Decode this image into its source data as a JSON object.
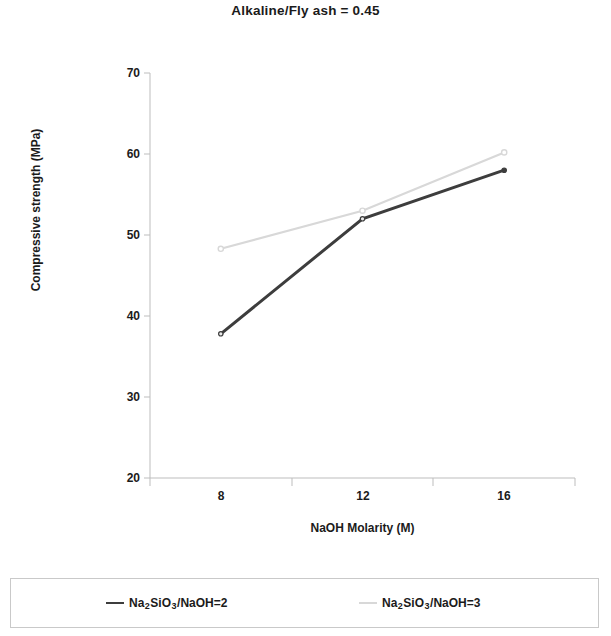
{
  "chart_data": {
    "type": "line",
    "title": "Alkaline/Fly ash = 0.45",
    "xlabel": "NaOH Molarity (M)",
    "ylabel": "Compressive strength (MPa)",
    "categories": [
      "8",
      "12",
      "16"
    ],
    "x": [
      8,
      12,
      16
    ],
    "xlim": [
      6,
      18
    ],
    "ylim": [
      20,
      70
    ],
    "yticks": [
      "20",
      "30",
      "40",
      "50",
      "60",
      "70"
    ],
    "ytick_values": [
      20,
      30,
      40,
      50,
      60,
      70
    ],
    "xticks": [
      "8",
      "12",
      "16"
    ],
    "grid": false,
    "legend_position": "bottom",
    "series": [
      {
        "name": "Na2SiO3/NaOH=2",
        "label_parts": {
          "pre": "Na",
          "sub1": "2",
          "mid": "SiO",
          "sub2": "3",
          "post": "/NaOH=2"
        },
        "color": "#3d3d3d",
        "values": [
          37.8,
          52.0,
          58.0
        ]
      },
      {
        "name": "Na2SiO3/NaOH=3",
        "label_parts": {
          "pre": "Na",
          "sub1": "2",
          "mid": "SiO",
          "sub2": "3",
          "post": "/NaOH=3"
        },
        "color": "#d8d8d8",
        "values": [
          48.3,
          53.0,
          60.2
        ]
      }
    ]
  },
  "axis_color": "#bdbdbd"
}
